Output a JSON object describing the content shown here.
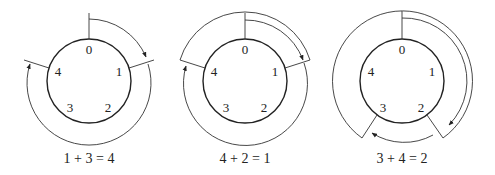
{
  "figure": {
    "diagrams": [
      {
        "id": "d1",
        "positions": [
          "0",
          "1",
          "2",
          "3",
          "4"
        ],
        "caption": "1 + 3 = 4",
        "start": 1,
        "step": 3,
        "result": 4
      },
      {
        "id": "d2",
        "positions": [
          "0",
          "1",
          "2",
          "3",
          "4"
        ],
        "caption": "4 + 2 = 1",
        "start": 4,
        "step": 2,
        "result": 1
      },
      {
        "id": "d3",
        "positions": [
          "0",
          "1",
          "2",
          "3",
          "4"
        ],
        "caption": "3 + 4 = 2",
        "start": 3,
        "step": 4,
        "result": 2
      }
    ]
  }
}
